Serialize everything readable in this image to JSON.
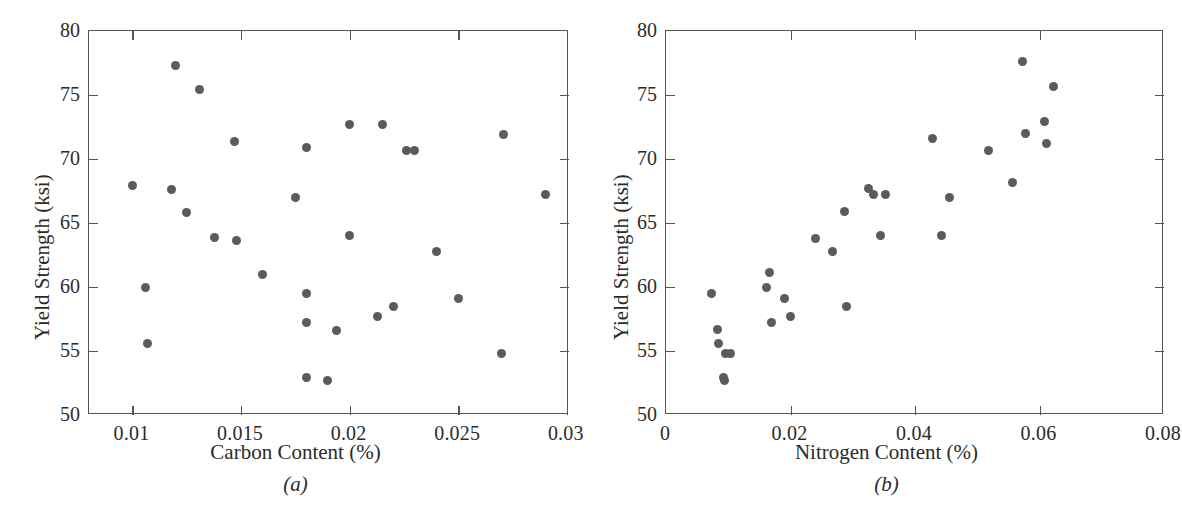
{
  "figure": {
    "panels": [
      {
        "id": "a",
        "caption": "(a)",
        "xlabel": "Carbon Content (%)",
        "ylabel": "Yield Strength (ksi)",
        "xticks": [
          "0.01",
          "0.015",
          "0.02",
          "0.025",
          "0.03"
        ],
        "xtickvals": [
          0.01,
          0.015,
          0.02,
          0.025,
          0.03
        ],
        "yticks": [
          "50",
          "55",
          "60",
          "65",
          "70",
          "75",
          "80"
        ],
        "ytickvals": [
          50,
          55,
          60,
          65,
          70,
          75,
          80
        ],
        "xlim": [
          0.008,
          0.0301
        ],
        "ylim": [
          50,
          80
        ]
      },
      {
        "id": "b",
        "caption": "(b)",
        "xlabel": "Nitrogen Content (%)",
        "ylabel": "Yield Strength (ksi)",
        "xticks": [
          "0",
          "0.02",
          "0.04",
          "0.06",
          "0.08"
        ],
        "xtickvals": [
          0,
          0.02,
          0.04,
          0.06,
          0.08
        ],
        "yticks": [
          "50",
          "55",
          "60",
          "65",
          "70",
          "75",
          "80"
        ],
        "ytickvals": [
          50,
          55,
          60,
          65,
          70,
          75,
          80
        ],
        "xlim": [
          0,
          0.08
        ],
        "ylim": [
          50,
          80
        ]
      }
    ]
  },
  "chart_data": [
    {
      "type": "scatter",
      "title": "",
      "panel": "(a)",
      "xlabel": "Carbon Content (%)",
      "ylabel": "Yield Strength (ksi)",
      "xlim": [
        0.008,
        0.0301
      ],
      "ylim": [
        50,
        80
      ],
      "xticks": [
        0.01,
        0.015,
        0.02,
        0.025,
        0.03
      ],
      "yticks": [
        50,
        55,
        60,
        65,
        70,
        75,
        80
      ],
      "grid": false,
      "legend": null,
      "marker_color": "#5b5b5b",
      "x": [
        0.01,
        0.0106,
        0.0107,
        0.0118,
        0.012,
        0.0125,
        0.0131,
        0.0138,
        0.0147,
        0.0148,
        0.016,
        0.0175,
        0.018,
        0.018,
        0.018,
        0.018,
        0.019,
        0.0194,
        0.02,
        0.02,
        0.0213,
        0.0215,
        0.022,
        0.0226,
        0.023,
        0.024,
        0.025,
        0.027,
        0.0271,
        0.029
      ],
      "y": [
        67.9,
        60.0,
        55.6,
        67.6,
        77.3,
        65.8,
        75.4,
        63.9,
        71.4,
        63.6,
        61.0,
        67.0,
        70.9,
        59.5,
        57.2,
        52.9,
        52.7,
        56.6,
        64.0,
        72.7,
        57.7,
        72.7,
        58.5,
        70.7,
        70.7,
        62.8,
        59.1,
        54.8,
        71.9,
        67.2
      ]
    },
    {
      "type": "scatter",
      "title": "",
      "panel": "(b)",
      "xlabel": "Nitrogen Content (%)",
      "ylabel": "Yield Strength (ksi)",
      "xlim": [
        0,
        0.08
      ],
      "ylim": [
        50,
        80
      ],
      "xticks": [
        0,
        0.02,
        0.04,
        0.06,
        0.08
      ],
      "yticks": [
        50,
        55,
        60,
        65,
        70,
        75,
        80
      ],
      "grid": false,
      "legend": null,
      "marker_color": "#5b5b5b",
      "x": [
        0.0073,
        0.0082,
        0.0085,
        0.0092,
        0.0094,
        0.0096,
        0.0103,
        0.0161,
        0.0167,
        0.017,
        0.019,
        0.02,
        0.024,
        0.0268,
        0.0287,
        0.029,
        0.0325,
        0.0333,
        0.0345,
        0.0352,
        0.0428,
        0.0443,
        0.0455,
        0.0518,
        0.0557,
        0.0572,
        0.0578,
        0.0608,
        0.0612,
        0.0622
      ],
      "y": [
        59.5,
        56.7,
        55.6,
        52.9,
        52.7,
        54.8,
        54.8,
        60.0,
        61.1,
        57.2,
        59.1,
        57.7,
        63.8,
        62.8,
        65.9,
        58.5,
        67.7,
        67.2,
        64.0,
        67.2,
        71.6,
        64.0,
        67.0,
        70.7,
        68.2,
        77.6,
        72.0,
        72.9,
        71.2,
        75.7
      ]
    }
  ]
}
